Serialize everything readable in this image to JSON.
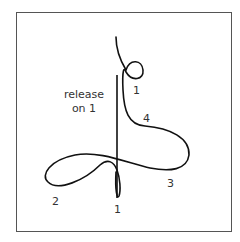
{
  "diagram": {
    "annotation_line1": "release",
    "annotation_line2": "on 1",
    "beat_labels": [
      {
        "text": "1",
        "x": 133,
        "y": 85
      },
      {
        "text": "4",
        "x": 143,
        "y": 113
      },
      {
        "text": "3",
        "x": 167,
        "y": 178
      },
      {
        "text": "2",
        "x": 52,
        "y": 196
      },
      {
        "text": "1",
        "x": 114,
        "y": 204
      }
    ],
    "stroke_color": "#111111",
    "frame_color": "#555555"
  }
}
